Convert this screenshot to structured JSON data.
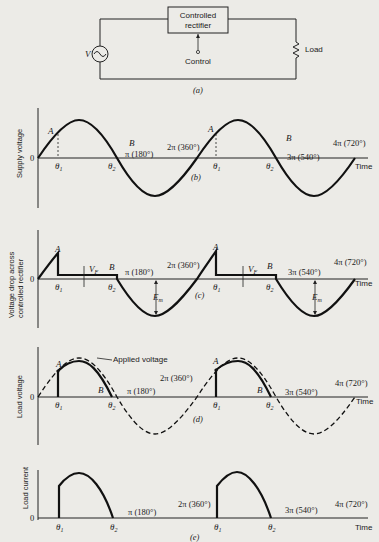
{
  "circuit": {
    "source_label": "V",
    "rectifier_label_line1": "Controlled",
    "rectifier_label_line2": "rectifier",
    "control_label": "Control",
    "load_label": "Load",
    "caption": "(a)"
  },
  "axis_common": {
    "origin_label": "0",
    "time_label": "Time",
    "theta1": "θ",
    "theta1_sub": "1",
    "theta2": "θ",
    "theta2_sub": "2",
    "pi": "π (180°)",
    "two_pi": "2π (360°)",
    "three_pi": "3π (540°)",
    "four_pi": "4π (720°)"
  },
  "panels": {
    "b": {
      "ylabel": "Supply voltage",
      "caption": "(b)",
      "point_a": "A",
      "point_b": "B"
    },
    "c": {
      "ylabel_line1": "Voltage drop across",
      "ylabel_line2": "controlled rectifier",
      "caption": "(c)",
      "point_a": "A",
      "point_b": "B",
      "vf_label": "V",
      "vf_sub": "F",
      "em_label": "E",
      "em_sub": "m"
    },
    "d": {
      "ylabel": "Load voltage",
      "caption": "(d)",
      "point_a": "A",
      "point_b": "B",
      "applied_label": "Applied voltage"
    },
    "e": {
      "ylabel": "Load current",
      "caption": "(e)"
    }
  }
}
